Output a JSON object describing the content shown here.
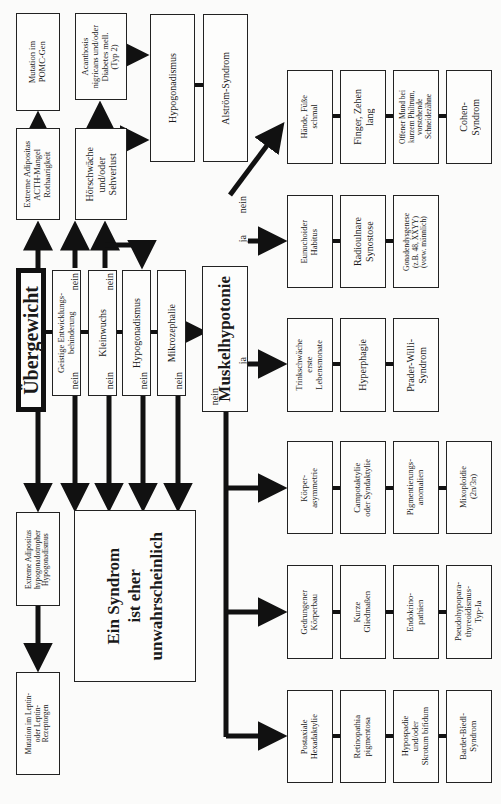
{
  "diagram": {
    "orientation": "rotated 90° counter-clockwise; text reads bottom-to-top",
    "root": {
      "label": "Übergewicht"
    },
    "criteria_column": [
      {
        "label": "Geistige Entwicklungs-\nbehinderung",
        "no_label_top": "nein",
        "no_label_bottom": "nein"
      },
      {
        "label": "Kleinwuchs",
        "no_label_top": "nein",
        "no_label_bottom": "nein"
      },
      {
        "label": "Hypogonadismus",
        "no_label_bottom": "nein"
      },
      {
        "label": "Mikrozephalie",
        "no_label_bottom": "nein"
      }
    ],
    "hub": {
      "label": "Muskelhypotonie",
      "ja_label": "ja",
      "nein_label": "nein"
    },
    "top_branch": {
      "adipositas_acth": "Extreme Adipositas\nACTH-Mangel\nRothaarigkeit",
      "pomc": "Mutation im\nPOMC-Gen",
      "hoerschwaeche": "Hörschwäche\nund/oder\nSehverlust",
      "acanthosis": "Acanthosis\nnigricans und/oder\nDiabetes mell.\n(Typ 2)",
      "hypogonadismus": "Hypogonadismus",
      "alstroem": "Alström-Syndrom"
    },
    "bottom_branch": {
      "adipositas_hypogon": "Extreme Adipositas\nhypogonadotropher\nHypogonadismus",
      "leptin": "Mutation im Leptin-\noder Leptin-\nRezeptorgen",
      "unlikely": "Ein Syndrom\nist eher\nunwahrscheinlich"
    },
    "rows": [
      {
        "name": "cohen",
        "items": [
          "Hände, Füße\nschmal",
          "Finger, Zehen\nlang",
          "Offener Mund bei\nkurzem Philtrum,\nvorstehende\nSchneidezähne",
          "Cohen-\nSyndrom"
        ]
      },
      {
        "name": "klinefelter",
        "items": [
          "Eunuchoider\nHabitus",
          "Radioulnare\nSynostose",
          "Gonadendysgenese\n(z.B. 48, XXYY)\n(vorw. männlich)"
        ]
      },
      {
        "name": "prader-willi",
        "items": [
          "Trinkschwäche\nerste\nLebensmonate",
          "Hyperphagie",
          "Prader-Willi-\nSyndrom"
        ]
      },
      {
        "name": "mixoploidie",
        "items": [
          "Körper-\nasymmetrie",
          "Campotaktylie\noder Syndaktylie",
          "Pigmentierungs-\nanomalien",
          "Mixoploidie\n(2n/3n)"
        ]
      },
      {
        "name": "pseudohypopara",
        "items": [
          "Gedrungener\nKörperbau",
          "Kurze\nGliedmaßen",
          "Endokrino-\npathien",
          "Pseudohypopara-\nthyreoidismus-\nTyp-Ia"
        ]
      },
      {
        "name": "bardet-biedl",
        "items": [
          "Postaxiale\nHexadaktylie",
          "Retinopathia\npigmentosa",
          "Hypospadie\nund/oder\nSkrotum bifidum",
          "Bardet-Biedl-\nSyndrom"
        ]
      }
    ]
  }
}
